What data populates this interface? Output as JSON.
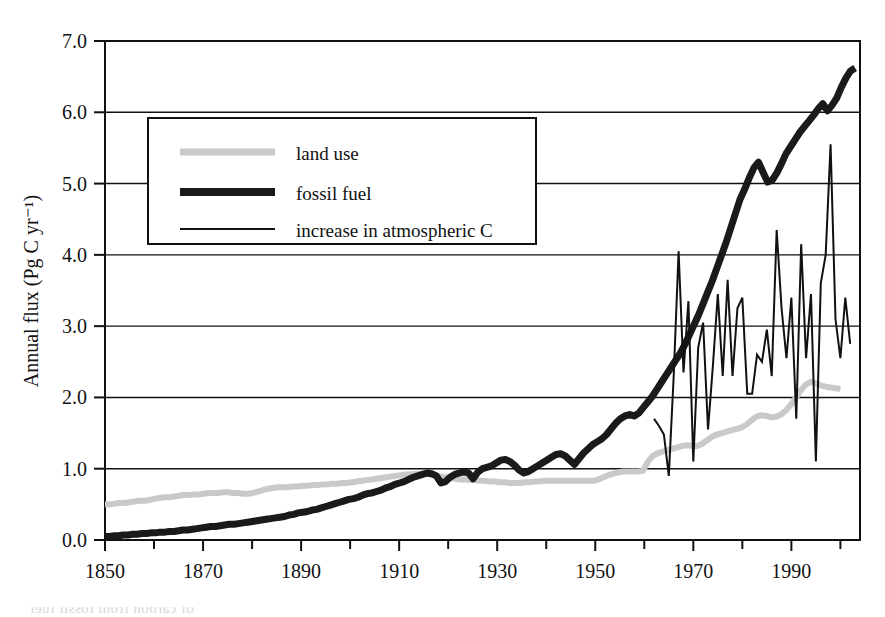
{
  "chart_data": {
    "type": "line",
    "title": "",
    "xlabel": "",
    "ylabel": "Annual flux (Pg C yr⁻¹)",
    "xlim": [
      1850,
      2004
    ],
    "ylim": [
      0.0,
      7.0
    ],
    "grid": true,
    "legend_position": "upper-left-inside",
    "x_ticks_major": [
      1850,
      1870,
      1890,
      1910,
      1930,
      1950,
      1970,
      1990
    ],
    "x_tick_labels": [
      "1850",
      "1870",
      "1890",
      "1910",
      "1930",
      "1950",
      "1970",
      "1990"
    ],
    "x_ticks_minor": [
      1860,
      1880,
      1900,
      1920,
      1940,
      1960,
      1980,
      2000
    ],
    "y_ticks": [
      0.0,
      1.0,
      2.0,
      3.0,
      4.0,
      5.0,
      6.0,
      7.0
    ],
    "y_tick_labels": [
      "0.0",
      "1.0",
      "2.0",
      "3.0",
      "4.0",
      "5.0",
      "6.0",
      "7.0"
    ],
    "series": [
      {
        "name": "land use",
        "style": "thick-light-gray",
        "color": "#c9c9c9",
        "width": 6,
        "x_start": 1850,
        "x_end": 2000,
        "values": [
          0.5,
          0.5,
          0.51,
          0.52,
          0.52,
          0.53,
          0.54,
          0.55,
          0.55,
          0.56,
          0.58,
          0.59,
          0.6,
          0.6,
          0.61,
          0.62,
          0.63,
          0.63,
          0.64,
          0.64,
          0.65,
          0.66,
          0.66,
          0.66,
          0.67,
          0.67,
          0.66,
          0.66,
          0.65,
          0.65,
          0.66,
          0.68,
          0.7,
          0.72,
          0.73,
          0.74,
          0.74,
          0.74,
          0.75,
          0.75,
          0.76,
          0.76,
          0.77,
          0.77,
          0.78,
          0.78,
          0.79,
          0.79,
          0.8,
          0.8,
          0.81,
          0.82,
          0.83,
          0.84,
          0.85,
          0.86,
          0.87,
          0.88,
          0.89,
          0.9,
          0.91,
          0.92,
          0.92,
          0.93,
          0.93,
          0.93,
          0.92,
          0.9,
          0.89,
          0.88,
          0.87,
          0.86,
          0.85,
          0.85,
          0.84,
          0.84,
          0.83,
          0.83,
          0.82,
          0.82,
          0.81,
          0.81,
          0.8,
          0.8,
          0.8,
          0.81,
          0.81,
          0.82,
          0.82,
          0.83,
          0.83,
          0.83,
          0.83,
          0.83,
          0.83,
          0.83,
          0.83,
          0.83,
          0.83,
          0.83,
          0.85,
          0.88,
          0.91,
          0.93,
          0.95,
          0.96,
          0.96,
          0.96,
          0.96,
          0.97,
          1.1,
          1.18,
          1.22,
          1.24,
          1.26,
          1.28,
          1.3,
          1.32,
          1.33,
          1.32,
          1.32,
          1.35,
          1.4,
          1.45,
          1.48,
          1.5,
          1.52,
          1.54,
          1.56,
          1.58,
          1.62,
          1.68,
          1.73,
          1.75,
          1.74,
          1.72,
          1.73,
          1.76,
          1.82,
          1.9,
          2.0,
          2.1,
          2.18,
          2.22,
          2.2,
          2.17,
          2.15,
          2.14,
          2.13,
          2.12
        ]
      },
      {
        "name": "fossil fuel",
        "style": "thick-black",
        "color": "#1a1a1a",
        "width": 7,
        "x_start": 1850,
        "x_end": 2003,
        "values": [
          0.05,
          0.05,
          0.06,
          0.06,
          0.07,
          0.07,
          0.08,
          0.08,
          0.09,
          0.09,
          0.1,
          0.1,
          0.11,
          0.11,
          0.12,
          0.12,
          0.13,
          0.14,
          0.14,
          0.15,
          0.16,
          0.17,
          0.18,
          0.19,
          0.19,
          0.2,
          0.21,
          0.22,
          0.22,
          0.23,
          0.24,
          0.25,
          0.26,
          0.27,
          0.28,
          0.29,
          0.3,
          0.31,
          0.32,
          0.33,
          0.35,
          0.36,
          0.38,
          0.39,
          0.4,
          0.42,
          0.43,
          0.45,
          0.47,
          0.49,
          0.51,
          0.53,
          0.55,
          0.57,
          0.58,
          0.6,
          0.63,
          0.65,
          0.66,
          0.68,
          0.7,
          0.73,
          0.75,
          0.78,
          0.8,
          0.82,
          0.85,
          0.88,
          0.9,
          0.92,
          0.94,
          0.93,
          0.9,
          0.8,
          0.82,
          0.88,
          0.92,
          0.94,
          0.96,
          0.94,
          0.86,
          0.95,
          1.0,
          1.02,
          1.04,
          1.08,
          1.12,
          1.13,
          1.1,
          1.05,
          0.98,
          0.94,
          0.96,
          1.0,
          1.04,
          1.08,
          1.12,
          1.16,
          1.2,
          1.21,
          1.18,
          1.12,
          1.06,
          1.14,
          1.22,
          1.28,
          1.34,
          1.38,
          1.42,
          1.48,
          1.56,
          1.64,
          1.7,
          1.74,
          1.76,
          1.74,
          1.78,
          1.86,
          1.94,
          2.02,
          2.12,
          2.22,
          2.32,
          2.42,
          2.52,
          2.62,
          2.74,
          2.88,
          3.02,
          3.16,
          3.32,
          3.48,
          3.64,
          3.82,
          4.0,
          4.18,
          4.38,
          4.58,
          4.78,
          4.92,
          5.08,
          5.22,
          5.3,
          5.16,
          5.02,
          5.05,
          5.15,
          5.28,
          5.42,
          5.52,
          5.62,
          5.72,
          5.8,
          5.88,
          5.96,
          6.05,
          6.12,
          6.02,
          6.1,
          6.2,
          6.35,
          6.48,
          6.58,
          6.62
        ]
      },
      {
        "name": "increase in atmospheric C",
        "style": "thin-black",
        "color": "#111111",
        "width": 2,
        "x_start": 1962,
        "x_end": 2002,
        "values": [
          1.7,
          1.6,
          1.48,
          0.9,
          2.3,
          4.05,
          2.35,
          3.35,
          1.1,
          2.7,
          3.05,
          1.55,
          2.45,
          3.45,
          2.3,
          3.65,
          2.3,
          3.25,
          3.4,
          2.05,
          2.05,
          2.6,
          2.5,
          2.95,
          2.3,
          4.35,
          3.25,
          2.55,
          3.4,
          1.7,
          4.15,
          2.55,
          3.45,
          1.1,
          3.6,
          4.0,
          5.55,
          3.1,
          2.55,
          3.4,
          2.75
        ]
      }
    ],
    "legend_entries": [
      {
        "label": "land use",
        "swatch": "thick-light-gray"
      },
      {
        "label": "fossil fuel",
        "swatch": "thick-black"
      },
      {
        "label": "increase in atmospheric C",
        "swatch": "thin-black"
      }
    ]
  },
  "page_bleed": [
    {
      "t": "nd atmospheric concentration of CO₂",
      "x": 20,
      "y": 42,
      "flip": false
    },
    {
      "t": "ol to less varied by 1850 temperature",
      "x": 20,
      "y": 66,
      "flip": true
    },
    {
      "t": "ation; however into the last",
      "x": 20,
      "y": 90,
      "flip": true
    },
    {
      "t": "the arc of the planet",
      "x": 20,
      "y": 114,
      "flip": true
    },
    {
      "t": "the same period that",
      "x": 20,
      "y": 138,
      "flip": true
    },
    {
      "t": "carbon the energy",
      "x": 20,
      "y": 186,
      "flip": true
    },
    {
      "t": "the source by",
      "x": 20,
      "y": 282,
      "flip": true
    },
    {
      "t": "to determine",
      "x": 20,
      "y": 306,
      "flip": true
    },
    {
      "t": "of the data",
      "x": 20,
      "y": 330,
      "flip": true
    },
    {
      "t": "is used to",
      "x": 20,
      "y": 354,
      "flip": true
    },
    {
      "t": "an probably well stand peaks of maps",
      "x": 470,
      "y": 42,
      "flip": true
    },
    {
      "t": "Confidence the concentration",
      "x": 470,
      "y": 66,
      "flip": true
    },
    {
      "t": "in the measurements are made",
      "x": 470,
      "y": 90,
      "flip": true
    },
    {
      "t": "and to the changes in carbon",
      "x": 470,
      "y": 114,
      "flip": true
    },
    {
      "t": "which has been observed",
      "x": 470,
      "y": 138,
      "flip": true
    },
    {
      "t": "emissions from land",
      "x": 470,
      "y": 186,
      "flip": true
    },
    {
      "t": "radiation of the period",
      "x": 470,
      "y": 282,
      "flip": true
    },
    {
      "t": "processes that are",
      "x": 470,
      "y": 306,
      "flip": true
    },
    {
      "t": "together with",
      "x": 470,
      "y": 330,
      "flip": true
    },
    {
      "t": "estimated and the tropics",
      "x": 30,
      "y": 578,
      "flip": true
    },
    {
      "t": "of carbon from fossil fuel",
      "x": 30,
      "y": 600,
      "flip": true
    },
    {
      "t": "reference and source of emissions",
      "x": 470,
      "y": 578,
      "flip": true
    }
  ]
}
